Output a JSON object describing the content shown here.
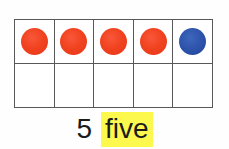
{
  "worksheet": {
    "kind": "ten-frame-counting-card",
    "background_color": "#fefefe"
  },
  "ten_frame": {
    "columns": 5,
    "rows": 2,
    "border_color": "#58585a",
    "cell_fill": "#ffffff",
    "counter_colors": {
      "red": "#f1421f",
      "blue": "#2d53ab"
    },
    "filled_count": 5,
    "total_cells": 10,
    "cells": [
      {
        "index": 1,
        "counter": "red",
        "label": "counter-red-1"
      },
      {
        "index": 2,
        "counter": "red",
        "label": "counter-red-2"
      },
      {
        "index": 3,
        "counter": "red",
        "label": "counter-red-3"
      },
      {
        "index": 4,
        "counter": "red",
        "label": "counter-red-4"
      },
      {
        "index": 5,
        "counter": "blue",
        "label": "counter-blue-1"
      },
      {
        "index": 6,
        "counter": "empty",
        "label": "empty-cell-1"
      },
      {
        "index": 7,
        "counter": "empty",
        "label": "empty-cell-2"
      },
      {
        "index": 8,
        "counter": "empty",
        "label": "empty-cell-3"
      },
      {
        "index": 9,
        "counter": "empty",
        "label": "empty-cell-4"
      },
      {
        "index": 10,
        "counter": "empty",
        "label": "empty-cell-5"
      }
    ]
  },
  "caption": {
    "numeral": "5",
    "word": "five",
    "word_highlight_color": "#fdf84e",
    "text_color": "#1b1b1b"
  }
}
